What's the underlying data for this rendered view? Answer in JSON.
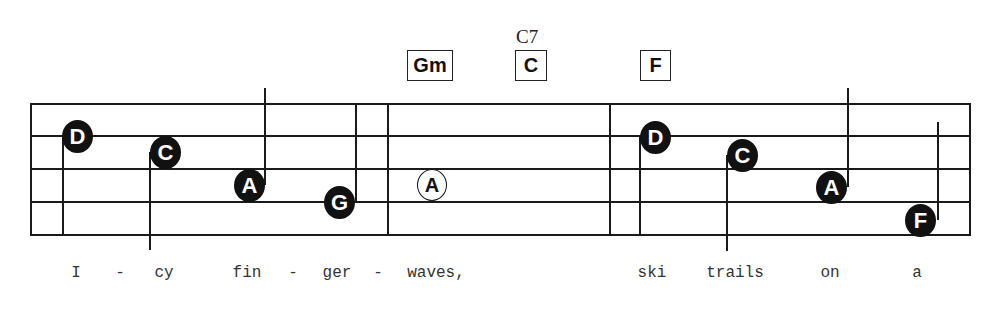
{
  "chords": [
    {
      "label": "Gm",
      "x": 407,
      "width": 46
    },
    {
      "label": "C",
      "alt_label": "C7",
      "x": 515,
      "width": 32
    },
    {
      "label": "F",
      "x": 640,
      "width": 31
    }
  ],
  "notes": [
    {
      "letter": "D",
      "filled": true,
      "cx": 77,
      "cy": 136,
      "stem": "down-left"
    },
    {
      "letter": "C",
      "filled": true,
      "cx": 165,
      "cy": 152,
      "stem": "down-left"
    },
    {
      "letter": "A",
      "filled": true,
      "cx": 250,
      "cy": 185,
      "stem": "up-right"
    },
    {
      "letter": "G",
      "filled": true,
      "cx": 340,
      "cy": 202,
      "stem": "up-right"
    },
    {
      "letter": "A",
      "filled": false,
      "cx": 432,
      "cy": 185,
      "stem": "none"
    },
    {
      "letter": "D",
      "filled": true,
      "cx": 656,
      "cy": 137,
      "stem": "down-left"
    },
    {
      "letter": "C",
      "filled": true,
      "cx": 742,
      "cy": 155,
      "stem": "down-left"
    },
    {
      "letter": "A",
      "filled": true,
      "cx": 832,
      "cy": 187,
      "stem": "up-right"
    },
    {
      "letter": "F",
      "filled": true,
      "cx": 920,
      "cy": 220,
      "stem": "up-right"
    }
  ],
  "lyrics": [
    {
      "text": "I",
      "x": 76
    },
    {
      "text": "-",
      "x": 120
    },
    {
      "text": "cy",
      "x": 164
    },
    {
      "text": "fin",
      "x": 247
    },
    {
      "text": "-",
      "x": 293
    },
    {
      "text": "ger",
      "x": 337
    },
    {
      "text": "-",
      "x": 378
    },
    {
      "text": "waves,",
      "x": 436
    },
    {
      "text": "ski",
      "x": 652
    },
    {
      "text": "trails",
      "x": 735
    },
    {
      "text": "on",
      "x": 830
    },
    {
      "text": "a",
      "x": 917
    }
  ],
  "colors": {
    "ink": "#111111",
    "paper": "#ffffff"
  }
}
